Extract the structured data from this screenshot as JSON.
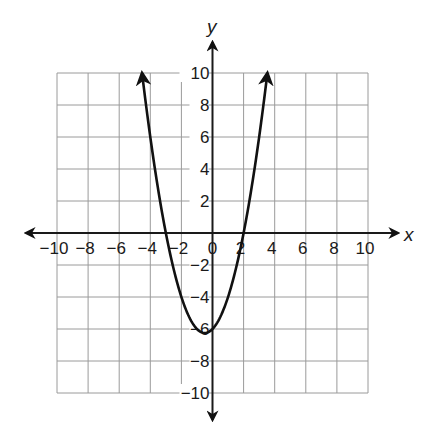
{
  "chart_data": {
    "type": "line",
    "title": "",
    "xlabel": "x",
    "ylabel": "y",
    "xlim": [
      -10,
      10
    ],
    "ylim": [
      -10,
      10
    ],
    "grid": true,
    "grid_step": 2,
    "x_ticks": [
      -10,
      -8,
      -6,
      -4,
      -2,
      0,
      2,
      4,
      6,
      8,
      10
    ],
    "y_ticks": [
      10,
      8,
      6,
      4,
      2,
      -2,
      -4,
      -6,
      -8,
      -10
    ],
    "x_tick_labels": [
      "−10",
      "−8",
      "−6",
      "−4",
      "−2",
      "0",
      "2",
      "4",
      "6",
      "8",
      "10"
    ],
    "y_tick_labels": [
      "10",
      "8",
      "6",
      "4",
      "2",
      "−2",
      "−4",
      "−6",
      "−8",
      "−10"
    ],
    "series": [
      {
        "name": "parabola",
        "equation": "y = x^2 + x - 6",
        "roots": [
          -3,
          2
        ],
        "vertex": [
          -0.5,
          -6.25
        ],
        "y_intercept": -6,
        "arrow_ends": true,
        "x": [
          -4.53,
          -4,
          -3,
          -2,
          -1,
          -0.5,
          0,
          1,
          2,
          3,
          3.53
        ],
        "y": [
          10,
          6,
          0,
          -4,
          -6,
          -6.25,
          -6,
          -4,
          0,
          6,
          10
        ]
      }
    ],
    "legend": null
  },
  "colors": {
    "grid": "#9a9a9a",
    "axis": "#1a1a1a",
    "curve": "#111111",
    "background": "#ffffff"
  }
}
